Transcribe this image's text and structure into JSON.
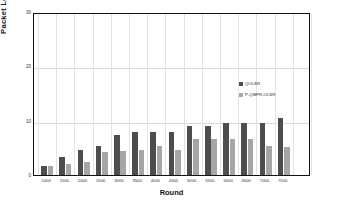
{
  "chart_data": {
    "type": "bar",
    "title": "",
    "xlabel": "Round",
    "ylabel": "Packet Loss rate %",
    "ylim": [
      0,
      30
    ],
    "yticks": [
      0,
      10,
      20,
      30
    ],
    "grid": true,
    "legend_position": "inside-right",
    "categories": [
      "1000",
      "1500",
      "2000",
      "2500",
      "3000",
      "3500",
      "4000",
      "4500",
      "5000",
      "5500",
      "6000",
      "6500",
      "7000",
      "7500"
    ],
    "series": [
      {
        "name": "QOLSR",
        "color": "#4d4d4d",
        "values": [
          1.6,
          3.3,
          4.6,
          5.3,
          7.4,
          8.0,
          8.0,
          8.0,
          9.0,
          9.0,
          9.6,
          9.6,
          9.6,
          10.5
        ]
      },
      {
        "name": "P-QMPR-OLSR",
        "color": "#a6a6a6",
        "values": [
          1.6,
          2.0,
          2.4,
          4.3,
          4.4,
          4.6,
          5.3,
          4.6,
          6.6,
          6.6,
          6.6,
          6.6,
          5.3,
          5.2
        ]
      }
    ]
  },
  "axes": {
    "y_title": "Packet Loss rate %",
    "x_title": "Round"
  }
}
